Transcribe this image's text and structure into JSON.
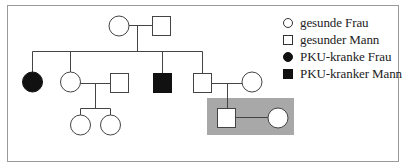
{
  "diagram": {
    "type": "pedigree",
    "title": "",
    "colors": {
      "frame": "#9a9a9a",
      "line": "#444444",
      "affected_fill": "#111111",
      "healthy_fill": "#ffffff",
      "highlight_box": "#a8a8a8"
    },
    "legend": {
      "items": [
        {
          "symbol": "circle-open",
          "label": "gesunde Frau"
        },
        {
          "symbol": "square-open",
          "label": "gesunder Mann"
        },
        {
          "symbol": "circle-filled",
          "label": "PKU-kranke Frau"
        },
        {
          "symbol": "square-filled",
          "label": "PKU-kranker Mann"
        }
      ]
    },
    "generations": [
      {
        "level": 1,
        "individuals": [
          {
            "id": "I-1",
            "sex": "female",
            "affected": false
          },
          {
            "id": "I-2",
            "sex": "male",
            "affected": false
          }
        ]
      },
      {
        "level": 2,
        "individuals": [
          {
            "id": "II-1",
            "sex": "female",
            "affected": true
          },
          {
            "id": "II-2",
            "sex": "female",
            "affected": false
          },
          {
            "id": "II-2-spouse",
            "sex": "male",
            "affected": false
          },
          {
            "id": "II-3",
            "sex": "male",
            "affected": true
          },
          {
            "id": "II-4",
            "sex": "male",
            "affected": false
          },
          {
            "id": "II-4-spouse",
            "sex": "female",
            "affected": false
          }
        ]
      },
      {
        "level": 3,
        "individuals": [
          {
            "id": "III-1",
            "sex": "female",
            "affected": false
          },
          {
            "id": "III-2",
            "sex": "female",
            "affected": false
          },
          {
            "id": "III-3",
            "sex": "male",
            "affected": false,
            "highlighted": true
          },
          {
            "id": "III-3-spouse",
            "sex": "female",
            "affected": false,
            "highlighted": true
          }
        ]
      }
    ]
  }
}
